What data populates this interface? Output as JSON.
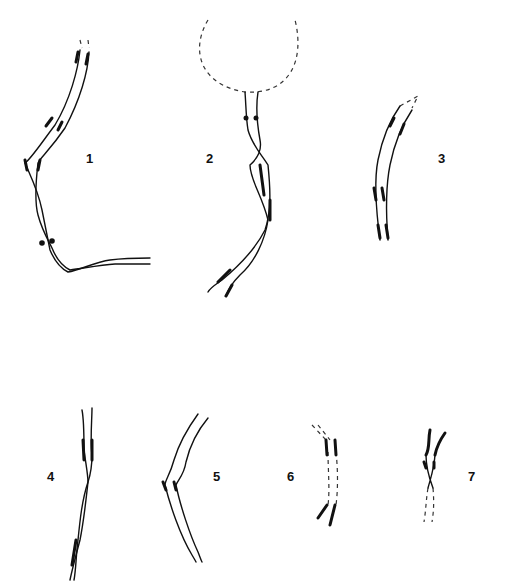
{
  "figure": {
    "panels": [
      {
        "id": "1",
        "label": "1"
      },
      {
        "id": "2",
        "label": "2"
      },
      {
        "id": "3",
        "label": "3"
      },
      {
        "id": "4",
        "label": "4"
      },
      {
        "id": "5",
        "label": "5"
      },
      {
        "id": "6",
        "label": "6"
      },
      {
        "id": "7",
        "label": "7"
      }
    ],
    "colors": {
      "ink": "#111111",
      "background": "#ffffff"
    }
  }
}
